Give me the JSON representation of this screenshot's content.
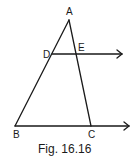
{
  "figure": {
    "caption": "Fig. 16.16",
    "points": {
      "A": {
        "label": "A"
      },
      "B": {
        "label": "B"
      },
      "C": {
        "label": "C"
      },
      "D": {
        "label": "D"
      },
      "E": {
        "label": "E"
      }
    },
    "segments": [
      "AB",
      "AC",
      "BC (ray)",
      "DE (ray)"
    ]
  }
}
